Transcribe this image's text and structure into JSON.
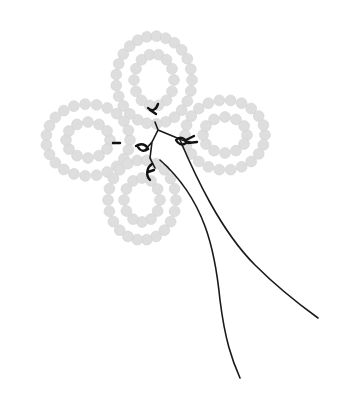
{
  "illustration": {
    "subject": "beaded four-petal flower with wire stems",
    "colors": {
      "background": "#ffffff",
      "bead": "#dedede",
      "bead_edge": "#d2d2d2",
      "wire": "#1a1a1a"
    },
    "petals": [
      {
        "name": "top",
        "cx": 154,
        "cy": 80,
        "rx": 38,
        "ry": 44,
        "inner_rx": 20,
        "inner_ry": 26
      },
      {
        "name": "right",
        "cx": 225,
        "cy": 135,
        "rx": 40,
        "ry": 35,
        "inner_rx": 22,
        "inner_ry": 18
      },
      {
        "name": "left",
        "cx": 88,
        "cy": 140,
        "rx": 42,
        "ry": 36,
        "inner_rx": 22,
        "inner_ry": 18
      },
      {
        "name": "bottom",
        "cx": 142,
        "cy": 200,
        "rx": 34,
        "ry": 40,
        "inner_rx": 18,
        "inner_ry": 22
      }
    ]
  }
}
